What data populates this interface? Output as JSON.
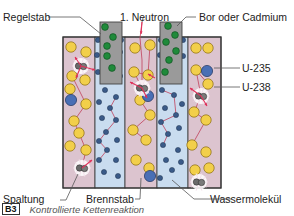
{
  "labels": {
    "control_rod": "Regelstab",
    "first_neutron": "1. Neutron",
    "absorber": "Bor oder Cadmium",
    "u235": "U-235",
    "u238": "U-238",
    "fission": "Spaltung",
    "fuel_rod": "Brennstab",
    "water_molecule": "Wassermolekül"
  },
  "caption": {
    "badge": "B3",
    "text": "Kontrollierte Kettenreaktion"
  },
  "colors": {
    "fuel_pink": "#dcc4cf",
    "water_blue": "#c9dcef",
    "rod_grey": "#9a9a9a",
    "u238_yellow": "#f2cf4a",
    "u235_blue": "#4a6fb5",
    "water_dot": "#3a5a88",
    "boron_green": "#1f8a3a",
    "neutron_red": "#e0305a",
    "path_line": "#c0405a"
  },
  "diagram": {
    "box": {
      "x": 63,
      "y": 37,
      "w": 158,
      "h": 151
    },
    "columns": [
      {
        "type": "fuel",
        "x": 63,
        "w": 32
      },
      {
        "type": "water",
        "x": 95,
        "w": 30
      },
      {
        "type": "fuel",
        "x": 125,
        "w": 32
      },
      {
        "type": "water",
        "x": 157,
        "w": 31
      },
      {
        "type": "fuel",
        "x": 188,
        "w": 33
      }
    ],
    "rods": [
      {
        "x": 100,
        "y": 22,
        "w": 22,
        "h": 62
      },
      {
        "x": 160,
        "y": 22,
        "w": 22,
        "h": 62
      }
    ],
    "boron": [
      [
        105,
        27
      ],
      [
        113,
        37
      ],
      [
        107,
        46
      ],
      [
        107,
        56
      ],
      [
        112,
        68
      ],
      [
        168,
        26
      ],
      [
        175,
        35
      ],
      [
        166,
        42
      ],
      [
        176,
        51
      ],
      [
        169,
        60
      ],
      [
        165,
        72
      ]
    ],
    "u238": [
      [
        71,
        47
      ],
      [
        86,
        52
      ],
      [
        72,
        76
      ],
      [
        85,
        80
      ],
      [
        70,
        89
      ],
      [
        86,
        104
      ],
      [
        74,
        121
      ],
      [
        79,
        133
      ],
      [
        70,
        146
      ],
      [
        86,
        150
      ],
      [
        135,
        48
      ],
      [
        150,
        45
      ],
      [
        134,
        72
      ],
      [
        148,
        75
      ],
      [
        140,
        100
      ],
      [
        150,
        115
      ],
      [
        133,
        130
      ],
      [
        146,
        140
      ],
      [
        136,
        160
      ],
      [
        149,
        168
      ],
      [
        196,
        48
      ],
      [
        208,
        48
      ],
      [
        196,
        70
      ],
      [
        208,
        84
      ],
      [
        194,
        112
      ],
      [
        206,
        120
      ],
      [
        192,
        145
      ],
      [
        206,
        152
      ],
      [
        195,
        170
      ],
      [
        209,
        168
      ]
    ],
    "u235": [
      [
        71,
        100
      ],
      [
        148,
        96
      ],
      [
        207,
        71
      ],
      [
        150,
        176
      ]
    ],
    "water": [
      [
        98,
        40
      ],
      [
        121,
        40
      ],
      [
        97,
        55
      ],
      [
        120,
        52
      ],
      [
        98,
        72
      ],
      [
        120,
        76
      ],
      [
        105,
        90
      ],
      [
        116,
        97
      ],
      [
        99,
        102
      ],
      [
        110,
        108
      ],
      [
        102,
        118
      ],
      [
        116,
        120
      ],
      [
        106,
        132
      ],
      [
        99,
        141
      ],
      [
        117,
        140
      ],
      [
        107,
        150
      ],
      [
        99,
        160
      ],
      [
        116,
        160
      ],
      [
        104,
        172
      ],
      [
        118,
        176
      ],
      [
        161,
        40
      ],
      [
        183,
        40
      ],
      [
        160,
        55
      ],
      [
        183,
        56
      ],
      [
        162,
        90
      ],
      [
        174,
        95
      ],
      [
        182,
        104
      ],
      [
        165,
        108
      ],
      [
        176,
        115
      ],
      [
        161,
        122
      ],
      [
        179,
        128
      ],
      [
        168,
        134
      ],
      [
        163,
        145
      ],
      [
        178,
        150
      ],
      [
        166,
        160
      ],
      [
        181,
        162
      ],
      [
        172,
        170
      ],
      [
        160,
        178
      ]
    ],
    "fissions": [
      [
        81,
        66
      ],
      [
        142,
        88
      ],
      [
        201,
        96
      ],
      [
        82,
        168
      ],
      [
        199,
        182
      ]
    ],
    "paths": [
      [
        [
          142,
          22
        ],
        [
          140,
          38
        ],
        [
          142,
          60
        ],
        [
          142,
          88
        ]
      ],
      [
        [
          82,
          168
        ],
        [
          86,
          150
        ],
        [
          79,
          133
        ],
        [
          74,
          121
        ],
        [
          86,
          104
        ],
        [
          72,
          76
        ]
      ],
      [
        [
          99,
          160
        ],
        [
          107,
          150
        ],
        [
          99,
          141
        ],
        [
          106,
          132
        ],
        [
          116,
          120
        ],
        [
          110,
          108
        ],
        [
          116,
          97
        ]
      ],
      [
        [
          142,
          88
        ],
        [
          134,
          72
        ],
        [
          148,
          75
        ],
        [
          150,
          45
        ]
      ],
      [
        [
          142,
          88
        ],
        [
          140,
          100
        ],
        [
          150,
          115
        ],
        [
          133,
          130
        ],
        [
          146,
          140
        ]
      ],
      [
        [
          162,
          90
        ],
        [
          174,
          95
        ],
        [
          176,
          115
        ],
        [
          161,
          122
        ],
        [
          168,
          134
        ],
        [
          163,
          145
        ]
      ],
      [
        [
          201,
          96
        ],
        [
          196,
          70
        ],
        [
          208,
          84
        ]
      ],
      [
        [
          201,
          96
        ],
        [
          194,
          112
        ],
        [
          206,
          120
        ],
        [
          192,
          145
        ]
      ]
    ],
    "neutron_arrows": [
      [
        [
          142,
          22
        ],
        [
          141,
          34
        ]
      ],
      [
        [
          81,
          66
        ],
        [
          75,
          57
        ]
      ],
      [
        [
          81,
          66
        ],
        [
          95,
          70
        ]
      ],
      [
        [
          81,
          66
        ],
        [
          76,
          78
        ]
      ],
      [
        [
          142,
          88
        ],
        [
          130,
          82
        ]
      ],
      [
        [
          142,
          88
        ],
        [
          147,
          98
        ]
      ],
      [
        [
          201,
          96
        ],
        [
          190,
          88
        ]
      ],
      [
        [
          201,
          96
        ],
        [
          207,
          106
        ]
      ],
      [
        [
          82,
          168
        ],
        [
          92,
          160
        ]
      ],
      [
        [
          155,
          78
        ],
        [
          148,
          74
        ]
      ]
    ]
  }
}
